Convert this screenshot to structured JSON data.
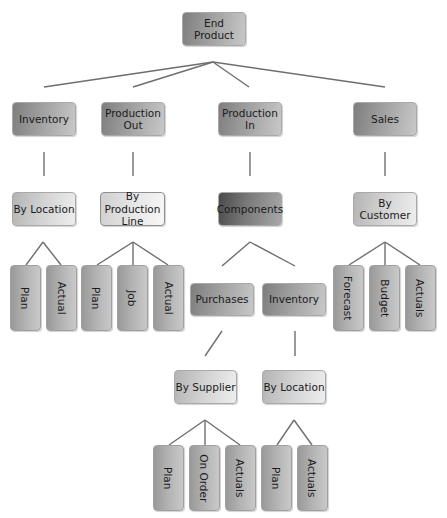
{
  "diagram": {
    "type": "hierarchy-tree",
    "root": {
      "label": "End Product",
      "children": [
        {
          "label": "Inventory",
          "children": [
            {
              "label": "By Location",
              "children": [
                {
                  "label": "Plan"
                },
                {
                  "label": "Actual"
                }
              ]
            }
          ]
        },
        {
          "label": "Production Out",
          "children": [
            {
              "label": "By Production Line",
              "children": [
                {
                  "label": "Plan"
                },
                {
                  "label": "Job"
                },
                {
                  "label": "Actual"
                }
              ]
            }
          ]
        },
        {
          "label": "Production In",
          "children": [
            {
              "label": "Components",
              "children": [
                {
                  "label": "Purchases",
                  "children": [
                    {
                      "label": "By Supplier",
                      "children": [
                        {
                          "label": "Plan"
                        },
                        {
                          "label": "On Order"
                        },
                        {
                          "label": "Actuals"
                        }
                      ]
                    }
                  ]
                },
                {
                  "label": "Inventory",
                  "children": [
                    {
                      "label": "By Location",
                      "children": [
                        {
                          "label": "Plan"
                        },
                        {
                          "label": "Actuals"
                        }
                      ]
                    }
                  ]
                }
              ]
            }
          ]
        },
        {
          "label": "Sales",
          "children": [
            {
              "label": "By Customer",
              "children": [
                {
                  "label": "Forecast"
                },
                {
                  "label": "Budget"
                },
                {
                  "label": "Actuals"
                }
              ]
            }
          ]
        }
      ]
    }
  },
  "nodes": {
    "end_product": "End Product",
    "inventory": "Inventory",
    "production_out_1": "Production",
    "production_out_2": "Out",
    "production_in_1": "Production",
    "production_in_2": "In",
    "sales": "Sales",
    "by_location": "By Location",
    "by_production_line_1": "By Production",
    "by_production_line_2": "Line",
    "components": "Components",
    "by_customer": "By Customer",
    "inv_plan": "Plan",
    "inv_actual": "Actual",
    "pl_plan": "Plan",
    "pl_job": "Job",
    "pl_actual": "Actual",
    "purchases": "Purchases",
    "comp_inventory": "Inventory",
    "by_supplier": "By Supplier",
    "comp_by_location": "By Location",
    "sup_plan": "Plan",
    "sup_on_order": "On Order",
    "sup_actuals": "Actuals",
    "loc_plan": "Plan",
    "loc_actuals": "Actuals",
    "cust_forecast": "Forecast",
    "cust_budget": "Budget",
    "cust_actuals": "Actuals"
  },
  "colors": {
    "connector": "#6e6e6e",
    "node_border": "#a9a9a9",
    "text": "#1b1b1b"
  }
}
